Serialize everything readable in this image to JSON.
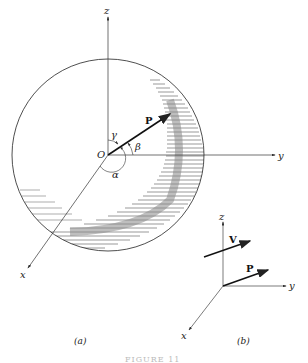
{
  "figure": {
    "panel_a": {
      "caption": "(a)",
      "axes": {
        "x": "x",
        "y": "y",
        "z": "z"
      },
      "origin_label": "O",
      "vector_label": "P",
      "angles": {
        "alpha": "α",
        "beta": "β",
        "gamma": "γ"
      }
    },
    "panel_b": {
      "caption": "(b)",
      "axes": {
        "x": "x",
        "y": "y",
        "z": "z"
      },
      "vectors": [
        "V",
        "P"
      ]
    },
    "figure_caption": "FIGURE 11"
  }
}
